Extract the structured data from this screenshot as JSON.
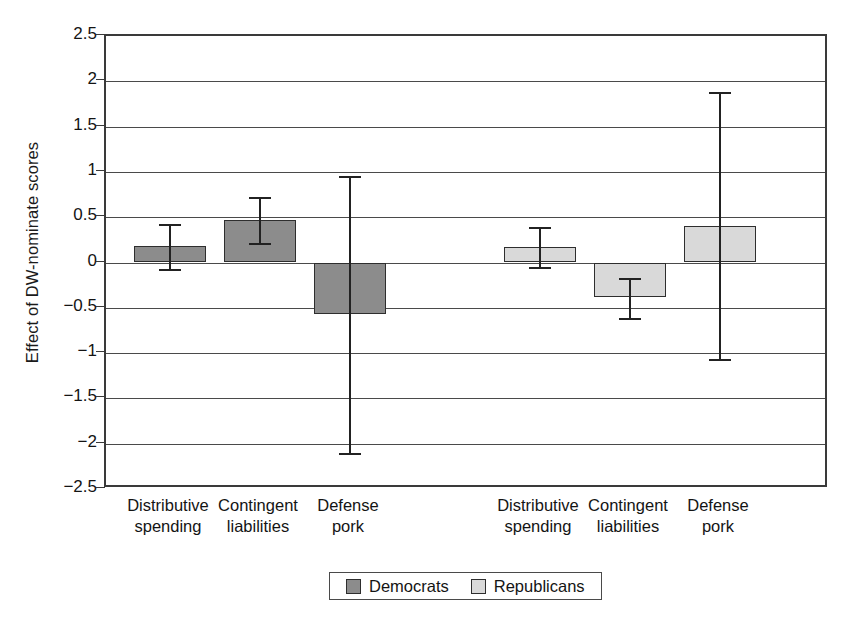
{
  "chart_data": {
    "type": "bar",
    "title": "",
    "subtitle": "",
    "xlabel": "",
    "ylabel": "Effect of DW-nominate scores",
    "ylim": [
      -2.5,
      2.5
    ],
    "ytick_labels": [
      "2.5",
      "2",
      "1.5",
      "1",
      "0.5",
      "0",
      "-0.5",
      "-1",
      "-1.5",
      "-2",
      "-2.5"
    ],
    "ytick_values": [
      2.5,
      2,
      1.5,
      1,
      0.5,
      0,
      -0.5,
      -1,
      -1.5,
      -2,
      -2.5
    ],
    "grid": true,
    "legend_position": "bottom",
    "categories": [
      "Distributive spending",
      "Contingent liabilities",
      "Defense pork"
    ],
    "category_lines": [
      [
        "Distributive",
        "spending"
      ],
      [
        "Contingent",
        "liabilities"
      ],
      [
        "Defense",
        "pork"
      ]
    ],
    "series": [
      {
        "name": "Democrats",
        "color": "#8c8c8c",
        "values": [
          0.18,
          0.47,
          -0.57
        ],
        "ci_low": [
          -0.07,
          0.21,
          -2.1
        ],
        "ci_high": [
          0.42,
          0.72,
          0.95
        ]
      },
      {
        "name": "Republicans",
        "color": "#d9d9d9",
        "values": [
          0.17,
          -0.38,
          0.4
        ],
        "ci_low": [
          -0.05,
          -0.61,
          -1.06
        ],
        "ci_high": [
          0.39,
          -0.17,
          1.88
        ]
      }
    ],
    "legend": [
      {
        "label": "Democrats",
        "color": "#8c8c8c"
      },
      {
        "label": "Republicans",
        "color": "#d9d9d9"
      }
    ]
  },
  "axis": {
    "y_title": "Effect of DW-nominate scores"
  },
  "xticks": [
    {
      "line1": "Distributive",
      "line2": "spending"
    },
    {
      "line1": "Contingent",
      "line2": "liabilities"
    },
    {
      "line1": "Defense",
      "line2": "pork"
    },
    {
      "line1": "Distributive",
      "line2": "spending"
    },
    {
      "line1": "Contingent",
      "line2": "liabilities"
    },
    {
      "line1": "Defense",
      "line2": "pork"
    }
  ],
  "yticks": [
    {
      "label": "2.5"
    },
    {
      "label": "2"
    },
    {
      "label": "1.5"
    },
    {
      "label": "1"
    },
    {
      "label": "0.5"
    },
    {
      "label": "0"
    },
    {
      "label": "-0.5"
    },
    {
      "label": "-1"
    },
    {
      "label": "-1.5"
    },
    {
      "label": "-2"
    },
    {
      "label": "-2.5"
    }
  ],
  "legend": {
    "items": [
      {
        "label": "Democrats"
      },
      {
        "label": "Republicans"
      }
    ]
  }
}
